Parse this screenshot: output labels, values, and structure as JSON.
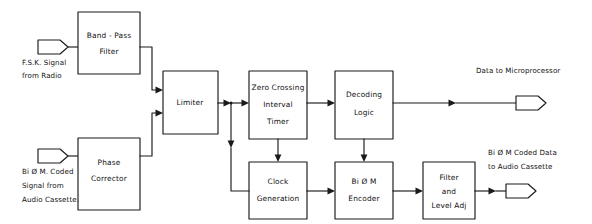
{
  "diagram": {
    "style": "hand-drawn",
    "ink_color": "#1a1a1a",
    "background_color": "#ffffff",
    "blocks": [
      {
        "id": "band_pass_filter",
        "lines": [
          "Band - Pass",
          "Filter"
        ]
      },
      {
        "id": "phase_corrector",
        "lines": [
          "Phase",
          "Corrector"
        ]
      },
      {
        "id": "limiter",
        "lines": [
          "Limiter"
        ]
      },
      {
        "id": "zero_crossing_timer",
        "lines": [
          "Zero Crossing",
          "Interval",
          "Timer"
        ]
      },
      {
        "id": "decoding_logic",
        "lines": [
          "Decoding",
          "Logic"
        ]
      },
      {
        "id": "clock_generation",
        "lines": [
          "Clock",
          "Generation"
        ]
      },
      {
        "id": "bi_phase_m_encoder",
        "lines": [
          "Bi Ø M",
          "Encoder"
        ]
      },
      {
        "id": "filter_level_adj",
        "lines": [
          "Filter",
          "and",
          "Level Adj"
        ]
      }
    ],
    "inputs": [
      {
        "id": "fsk_signal_input",
        "lines": [
          "F.S.K. Signal",
          "from Radio"
        ]
      },
      {
        "id": "bi_phase_m_input",
        "lines": [
          "Bi Ø M. Coded",
          "Signal  from",
          "Audio Cassette."
        ]
      }
    ],
    "outputs": [
      {
        "id": "microprocessor_output",
        "lines": [
          "Data  to  Microprocessor"
        ]
      },
      {
        "id": "audio_cassette_output",
        "lines": [
          "Bi Ø M Coded Data",
          "to Audio Cassette"
        ]
      }
    ]
  }
}
